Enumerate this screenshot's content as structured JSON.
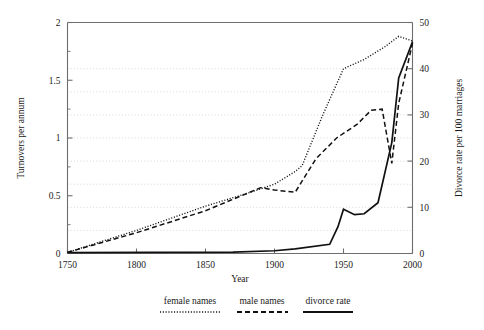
{
  "chart_data": {
    "type": "line",
    "title": "",
    "xlabel": "Year",
    "ylabel": "Turnovers per annum",
    "y2label": "Divorce rate per 100 marriages",
    "xlim": [
      1750,
      2000
    ],
    "ylim": [
      0,
      2
    ],
    "y2lim": [
      0,
      50
    ],
    "xticks": [
      1750,
      1800,
      1850,
      1900,
      1950,
      2000
    ],
    "xticklabels": [
      "1750",
      "1800",
      "1850",
      "1900",
      "1950",
      "2000"
    ],
    "yticks": [
      0,
      0.5,
      1,
      1.5,
      2
    ],
    "yticklabels": [
      "0",
      "0.5",
      "1",
      "1.5",
      "2"
    ],
    "yminorticks": [
      0.25,
      0.75,
      1.25,
      1.75
    ],
    "y2ticks": [
      0,
      10,
      20,
      30,
      40,
      50
    ],
    "y2ticklabels": [
      "0",
      "10",
      "20",
      "30",
      "40",
      "50"
    ],
    "grid": true,
    "gridlines_y2": [
      10,
      20,
      30,
      40
    ],
    "gridlines_extra_y": [
      0.2,
      0.6,
      1.0,
      1.4,
      1.6
    ],
    "legend_position": "below",
    "series": [
      {
        "name": "female names",
        "axis": "left",
        "style": "dotted",
        "x": [
          1750,
          1800,
          1850,
          1880,
          1900,
          1915,
          1920,
          1935,
          1950,
          1965,
          1980,
          1990,
          2000
        ],
        "y": [
          0.01,
          0.2,
          0.41,
          0.52,
          0.6,
          0.71,
          0.76,
          1.2,
          1.6,
          1.68,
          1.79,
          1.88,
          1.84
        ]
      },
      {
        "name": "male names",
        "axis": "left",
        "style": "dashed",
        "x": [
          1750,
          1800,
          1850,
          1880,
          1890,
          1900,
          1915,
          1930,
          1945,
          1960,
          1970,
          1978,
          1985,
          1990,
          2000
        ],
        "y": [
          0.01,
          0.18,
          0.37,
          0.52,
          0.57,
          0.55,
          0.53,
          0.82,
          1.0,
          1.12,
          1.24,
          1.25,
          0.78,
          1.3,
          1.82
        ]
      },
      {
        "name": "divorce rate",
        "axis": "right",
        "style": "solid",
        "x": [
          1750,
          1870,
          1900,
          1915,
          1940,
          1946,
          1950,
          1958,
          1965,
          1975,
          1985,
          1990,
          2000
        ],
        "y": [
          0.2,
          0.3,
          0.6,
          1.0,
          2.0,
          5.8,
          9.6,
          8.4,
          8.6,
          11.0,
          24.0,
          38.0,
          45.8
        ]
      }
    ]
  },
  "legend": {
    "items": [
      {
        "label": "female names",
        "style": "dotted"
      },
      {
        "label": "male names",
        "style": "dashed"
      },
      {
        "label": "divorce rate",
        "style": "solid"
      }
    ]
  },
  "axes": {
    "x_label": "Year",
    "y_left_label": "Turnovers per annum",
    "y_right_label": "Divorce rate per 100 marriages"
  }
}
